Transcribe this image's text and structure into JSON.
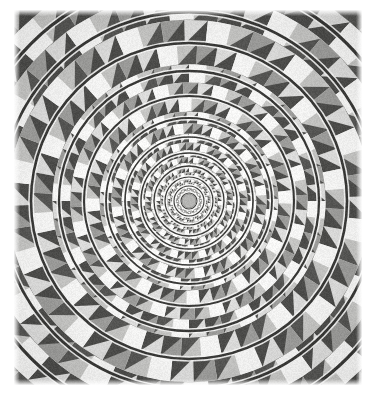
{
  "page": {
    "width": 378,
    "height": 399,
    "background_color": "#ffffff",
    "title": "Fraser spiral / concentric circles optical illusion figure",
    "caption": ""
  },
  "figure": {
    "name": "concentric-circles-checkerboard-illusion",
    "description": "Scanned grayscale optical illusion: a radial checkerboard of white, light gray, mid gray and dark gray cells arranged in logarithmically spaced concentric rings, overlaid by twelve dark concentric circular arcs that appear to form a single spiral.",
    "plate_rect": {
      "x": 14,
      "y": 10,
      "width": 348,
      "height": 375
    },
    "center": {
      "x": 189,
      "y": 201
    },
    "paper_tint": "#f4f4f2",
    "scan_noise": 0.055,
    "vignette": 0.12
  },
  "checkerboard": {
    "angular_sectors": 48,
    "radial_rings": 26,
    "inner_radius": 7,
    "outer_radius": 300,
    "growth_ratio": 1.152,
    "twist_per_ring_deg": 3.0,
    "tones": {
      "white": "#fbfbfa",
      "light_gray": "#c9c9c7",
      "mid_gray": "#a0a09e",
      "dark_gray": "#4e4e4c"
    },
    "tone_cycle": [
      "white",
      "light_gray",
      "mid_gray",
      "dark_gray"
    ],
    "wedge_split": true
  },
  "rings": {
    "count": 12,
    "stroke_color": "#3a3a38",
    "halo_color": "#fdfdfc",
    "halo_width_px": 3.1,
    "line_width_min_px": 1.0,
    "line_width_max_px": 3.2,
    "radii": [
      8,
      15,
      24,
      35,
      48,
      64,
      83,
      105,
      130,
      158,
      189,
      223
    ],
    "spiral_offset_deg": 11
  },
  "core": {
    "radius": 7,
    "fill_color": "#b6b6b4",
    "ring_color": "#8d8d8b"
  },
  "labels": {
    "figure_alt": "Optical illusion: concentric circles on a twisted checkerboard appear as a spiral"
  }
}
